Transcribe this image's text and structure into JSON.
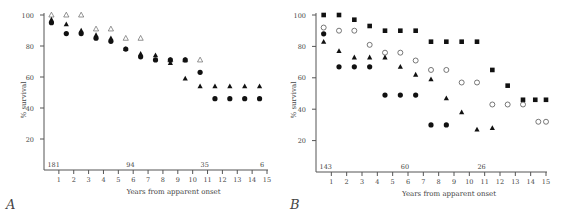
{
  "panels": [
    {
      "label": "A",
      "ylabel": "% survival",
      "xlabel": "Years from apparent onset",
      "yticks": [
        20,
        40,
        60,
        80,
        100
      ],
      "xticks": [
        1,
        2,
        3,
        4,
        5,
        6,
        7,
        8,
        9,
        10,
        11,
        12,
        13,
        14,
        15
      ],
      "counts": [
        {
          "text": "181",
          "x": 0.1
        },
        {
          "text": "94",
          "x": 5.4
        },
        {
          "text": "35",
          "x": 10.4
        },
        {
          "text": "6",
          "x": 14.4
        }
      ]
    },
    {
      "label": "B",
      "ylabel": "% survival",
      "xlabel": "Years from apparent onset",
      "yticks": [
        20,
        40,
        60,
        80,
        100
      ],
      "xticks": [
        1,
        2,
        3,
        4,
        5,
        6,
        7,
        8,
        9,
        10,
        11,
        12,
        13,
        14,
        15
      ],
      "counts": [
        {
          "text": "143",
          "x": 0.1
        },
        {
          "text": "60",
          "x": 5.4
        },
        {
          "text": "26",
          "x": 10.4
        }
      ]
    }
  ],
  "chart_data": [
    {
      "type": "scatter",
      "title": "A",
      "xlabel": "Years from apparent onset",
      "ylabel": "% survival",
      "xlim": [
        0,
        15
      ],
      "ylim": [
        0,
        100
      ],
      "grid": false,
      "series": [
        {
          "name": "open triangle",
          "marker": "triangle-open",
          "x": [
            0.5,
            1.5,
            2.5,
            3.5,
            4.5,
            5.5,
            6.5,
            8.5,
            9.5,
            10.5
          ],
          "y": [
            100,
            100,
            100,
            91,
            91,
            85,
            85,
            71,
            71,
            71
          ]
        },
        {
          "name": "filled triangle",
          "marker": "triangle",
          "x": [
            0.5,
            1.5,
            2.5,
            3.5,
            4.5,
            5.5,
            6.5,
            7.5,
            8.5,
            9.5,
            10.5,
            11.5,
            12.5,
            13.5,
            14.5
          ],
          "y": [
            97,
            94,
            90,
            87,
            85,
            78,
            75,
            74,
            69,
            59,
            54,
            54,
            54,
            54,
            54
          ]
        },
        {
          "name": "filled circle",
          "marker": "circle",
          "x": [
            0.5,
            1.5,
            2.5,
            3.5,
            4.5,
            5.5,
            6.5,
            7.5,
            8.5,
            9.5,
            10.5,
            11.5,
            12.5,
            13.5,
            14.5
          ],
          "y": [
            95,
            88,
            88,
            85,
            83,
            78,
            73,
            71,
            71,
            71,
            63,
            46,
            46,
            46,
            46
          ]
        }
      ],
      "annotations": [
        "181",
        "94",
        "35",
        "6"
      ]
    },
    {
      "type": "scatter",
      "title": "B",
      "xlabel": "Years from apparent onset",
      "ylabel": "% survival",
      "xlim": [
        0,
        15
      ],
      "ylim": [
        0,
        100
      ],
      "grid": false,
      "series": [
        {
          "name": "filled square",
          "marker": "square",
          "x": [
            0.5,
            1.5,
            2.5,
            3.5,
            4.5,
            5.5,
            6.5,
            7.5,
            8.5,
            9.5,
            10.5,
            11.5,
            12.5,
            13.5,
            14.3,
            15
          ],
          "y": [
            100,
            100,
            97,
            93,
            90,
            90,
            90,
            83,
            83,
            83,
            83,
            65,
            55,
            46,
            46,
            46
          ]
        },
        {
          "name": "open circle",
          "marker": "circle-open",
          "x": [
            0.5,
            1.5,
            2.5,
            3.5,
            4.5,
            5.5,
            6.5,
            7.5,
            8.5,
            9.5,
            10.5,
            11.5,
            12.5,
            13.5,
            14.5,
            15
          ],
          "y": [
            92,
            90,
            90,
            81,
            76,
            76,
            71,
            65,
            65,
            57,
            57,
            43,
            43,
            43,
            32,
            32
          ]
        },
        {
          "name": "filled triangle",
          "marker": "triangle",
          "x": [
            0.5,
            1.5,
            2.5,
            3.5,
            4.5,
            5.5,
            6.5,
            7.5,
            8.5,
            9.5,
            10.5,
            11.5
          ],
          "y": [
            83,
            77,
            73,
            73,
            73,
            67,
            62,
            59,
            47,
            38,
            27,
            28
          ]
        },
        {
          "name": "filled circle",
          "marker": "circle",
          "x": [
            0.5,
            1.5,
            2.5,
            3.5,
            4.5,
            5.5,
            6.5,
            7.5,
            8.5
          ],
          "y": [
            88,
            67,
            67,
            67,
            49,
            49,
            49,
            30,
            30
          ]
        }
      ],
      "annotations": [
        "143",
        "60",
        "26"
      ]
    }
  ]
}
